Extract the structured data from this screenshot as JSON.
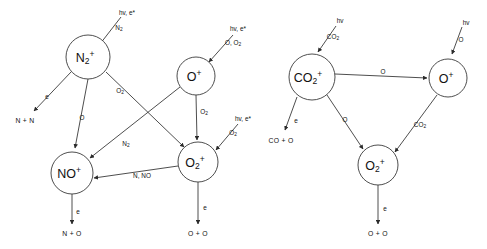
{
  "figure": {
    "width": 487,
    "height": 249,
    "background": "#ffffff",
    "stroke_color": "#3a3a3a",
    "text_color": "#111111",
    "corner_mark": "",
    "panels": [
      {
        "id": "earth-ionosphere",
        "nodes": [
          {
            "id": "n2p",
            "label_main": "N",
            "label_sub": "2",
            "label_sup": "+",
            "cx": 88,
            "cy": 57,
            "r": 22
          },
          {
            "id": "op",
            "label_main": "O",
            "label_sub": "",
            "label_sup": "+",
            "cx": 196,
            "cy": 76,
            "r": 19
          },
          {
            "id": "nop",
            "label_main": "NO",
            "label_sub": "",
            "label_sup": "+",
            "cx": 72,
            "cy": 173,
            "r": 21
          },
          {
            "id": "o2p",
            "label_main": "O",
            "label_sub": "2",
            "label_sup": "+",
            "cx": 198,
            "cy": 162,
            "r": 20
          }
        ],
        "source_labels": [
          {
            "id": "src-n2p",
            "lines": [
              "hv, e*",
              "N2"
            ],
            "x": 127,
            "y": 12
          },
          {
            "id": "src-op",
            "lines": [
              "hv, e*",
              "O, O2"
            ],
            "x": 238,
            "y": 28
          },
          {
            "id": "src-o2p",
            "lines": [
              "hv, e*",
              "O2"
            ],
            "x": 243,
            "y": 118
          }
        ],
        "terminals": [
          {
            "id": "term-nn",
            "label": "N + N",
            "x": 25,
            "y": 120
          },
          {
            "id": "term-no",
            "label": "N + O",
            "x": 72,
            "y": 233
          },
          {
            "id": "term-oo",
            "label": "O + O",
            "x": 198,
            "y": 233
          }
        ],
        "edge_labels": [
          {
            "id": "lbl-n2p-nn",
            "text": "e",
            "x": 47,
            "y": 96
          },
          {
            "id": "lbl-n2p-nop",
            "text": "O",
            "x": 82,
            "y": 117
          },
          {
            "id": "lbl-n2p-o2p",
            "text": "O2",
            "x": 120,
            "y": 90
          },
          {
            "id": "lbl-op-o2p",
            "text": "O2",
            "x": 204,
            "y": 111
          },
          {
            "id": "lbl-op-nop",
            "text": "N2",
            "x": 126,
            "y": 143
          },
          {
            "id": "lbl-o2p-nop",
            "text": "N, NO",
            "x": 142,
            "y": 175
          },
          {
            "id": "lbl-nop-no",
            "text": "e",
            "x": 78,
            "y": 211
          },
          {
            "id": "lbl-o2p-oo",
            "text": "e",
            "x": 205,
            "y": 207
          }
        ]
      },
      {
        "id": "mars-venus-ionosphere",
        "nodes": [
          {
            "id": "co2p",
            "label_main": "CO",
            "label_sub": "2",
            "label_sup": "+",
            "cx": 312,
            "cy": 77,
            "r": 23
          },
          {
            "id": "op2",
            "label_main": "O",
            "label_sub": "",
            "label_sup": "+",
            "cx": 448,
            "cy": 78,
            "r": 19
          },
          {
            "id": "o2p2",
            "label_main": "O",
            "label_sub": "2",
            "label_sup": "+",
            "cx": 378,
            "cy": 165,
            "r": 20
          }
        ],
        "source_labels": [
          {
            "id": "src-co2p",
            "lines": [
              "hv",
              "CO2"
            ],
            "x": 340,
            "y": 20
          },
          {
            "id": "src-op2",
            "lines": [
              "hv",
              "O"
            ],
            "x": 466,
            "y": 22
          }
        ],
        "terminals": [
          {
            "id": "term-coo",
            "label": "CO + O",
            "x": 281,
            "y": 140
          },
          {
            "id": "term-oo2",
            "label": "O + O",
            "x": 378,
            "y": 233
          }
        ],
        "edge_labels": [
          {
            "id": "lbl-co2p-op",
            "text": "O",
            "x": 383,
            "y": 71
          },
          {
            "id": "lbl-co2p-coo",
            "text": "e",
            "x": 296,
            "y": 120
          },
          {
            "id": "lbl-co2p-o2p",
            "text": "O",
            "x": 345,
            "y": 119
          },
          {
            "id": "lbl-op-o2p2",
            "text": "CO2",
            "x": 420,
            "y": 124
          },
          {
            "id": "lbl-o2p2-oo",
            "text": "e",
            "x": 385,
            "y": 208
          }
        ]
      }
    ]
  }
}
